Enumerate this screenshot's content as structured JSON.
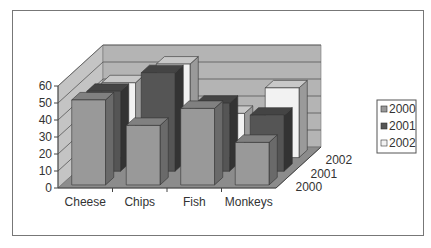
{
  "chart_data": {
    "type": "bar",
    "style": "3d-clustered-depth",
    "title": "",
    "xlabel": "",
    "ylabel": "",
    "categories": [
      "Cheese",
      "Chips",
      "Fish",
      "Monkeys"
    ],
    "series": [
      {
        "name": "2000",
        "values": [
          50,
          35,
          45,
          25
        ],
        "color": "#999999",
        "side": "#6a6a6a",
        "top": "#808080"
      },
      {
        "name": "2001",
        "values": [
          47,
          58,
          40,
          33
        ],
        "color": "#555555",
        "side": "#333333",
        "top": "#444444"
      },
      {
        "name": "2002",
        "values": [
          44,
          55,
          26,
          41
        ],
        "color": "#f2f2f2",
        "side": "#9a9a9a",
        "top": "#c8c8c8"
      }
    ],
    "yticks": [
      0,
      10,
      20,
      30,
      40,
      50,
      60
    ],
    "ylim": [
      0,
      60
    ],
    "grid": true,
    "legend": {
      "position": "right",
      "entries": [
        "2000",
        "2001",
        "2002"
      ]
    },
    "depth_labels": [
      "2000",
      "2001",
      "2002"
    ],
    "colors": {
      "back_wall": "#b4b4b4",
      "side_wall": "#c4c4c4",
      "floor": "#8c8c8c",
      "gridline": "#555555"
    }
  }
}
